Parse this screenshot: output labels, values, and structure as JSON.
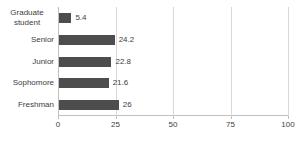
{
  "chart_data": {
    "type": "bar",
    "orientation": "horizontal",
    "title": "",
    "xlabel": "",
    "ylabel": "",
    "categories": [
      "Graduate student",
      "Senior",
      "Junior",
      "Sophomore",
      "Freshman"
    ],
    "values": [
      5.4,
      24.2,
      22.8,
      21.6,
      26
    ],
    "value_labels": [
      "5.4",
      "24.2",
      "22.8",
      "21.6",
      "26"
    ],
    "xlim": [
      0,
      100
    ],
    "x_ticks": [
      0,
      25,
      50,
      75,
      100
    ],
    "grid": true,
    "legend": "none",
    "bar_color": "#4d4d4d",
    "gridline_color": "#d9d9d9",
    "axis_color": "#bfbfbf",
    "text_color": "#404040"
  }
}
